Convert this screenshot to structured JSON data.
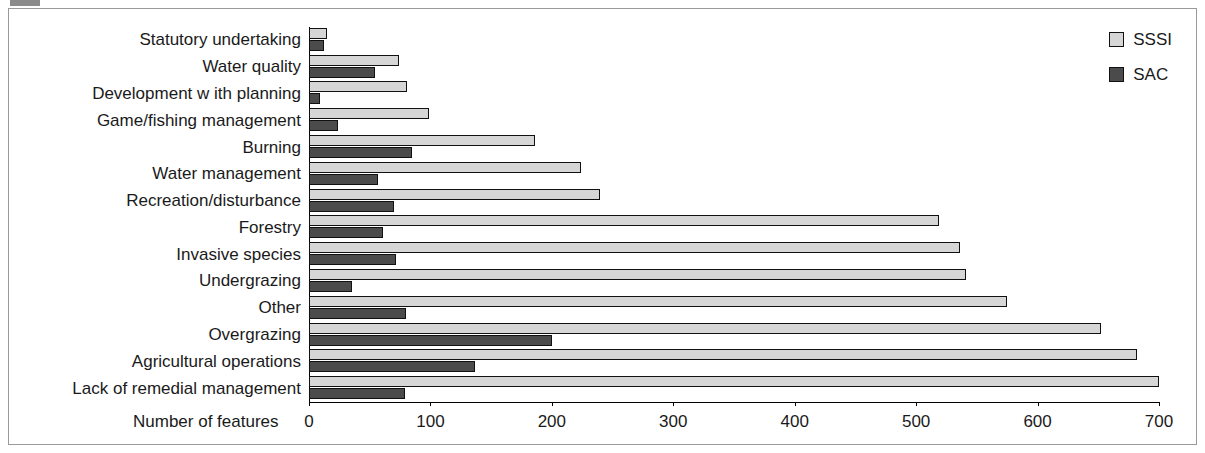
{
  "chart_data": {
    "type": "bar",
    "orientation": "horizontal",
    "title": "",
    "xlabel": "Number of features",
    "ylabel": "",
    "xlim": [
      0,
      700
    ],
    "xticks": [
      0,
      100,
      200,
      300,
      400,
      500,
      600,
      700
    ],
    "xtick_labels": [
      "0",
      "100",
      "200",
      "300",
      "400",
      "500",
      "600",
      "700"
    ],
    "grid": false,
    "legend_position": "top-right",
    "categories": [
      "Statutory undertaking",
      "Water quality",
      "Development w ith planning",
      "Game/fishing management",
      "Burning",
      "Water management",
      "Recreation/disturbance",
      "Forestry",
      "Invasive species",
      "Undergrazing",
      "Other",
      "Overgrazing",
      "Agricultural operations",
      "Lack of remedial management"
    ],
    "series": [
      {
        "name": "SSSI",
        "color": "#d6d6d6",
        "values": [
          15,
          74,
          81,
          99,
          186,
          224,
          240,
          519,
          536,
          541,
          575,
          652,
          682,
          700
        ]
      },
      {
        "name": "SAC",
        "color": "#4b4b4b",
        "values": [
          12,
          54,
          9,
          24,
          85,
          57,
          70,
          61,
          72,
          35,
          80,
          200,
          137,
          79
        ]
      }
    ]
  },
  "legend": {
    "items": [
      {
        "label": "SSSI",
        "swatch": "light-gray-square"
      },
      {
        "label": "SAC",
        "swatch": "dark-gray-square"
      }
    ]
  }
}
